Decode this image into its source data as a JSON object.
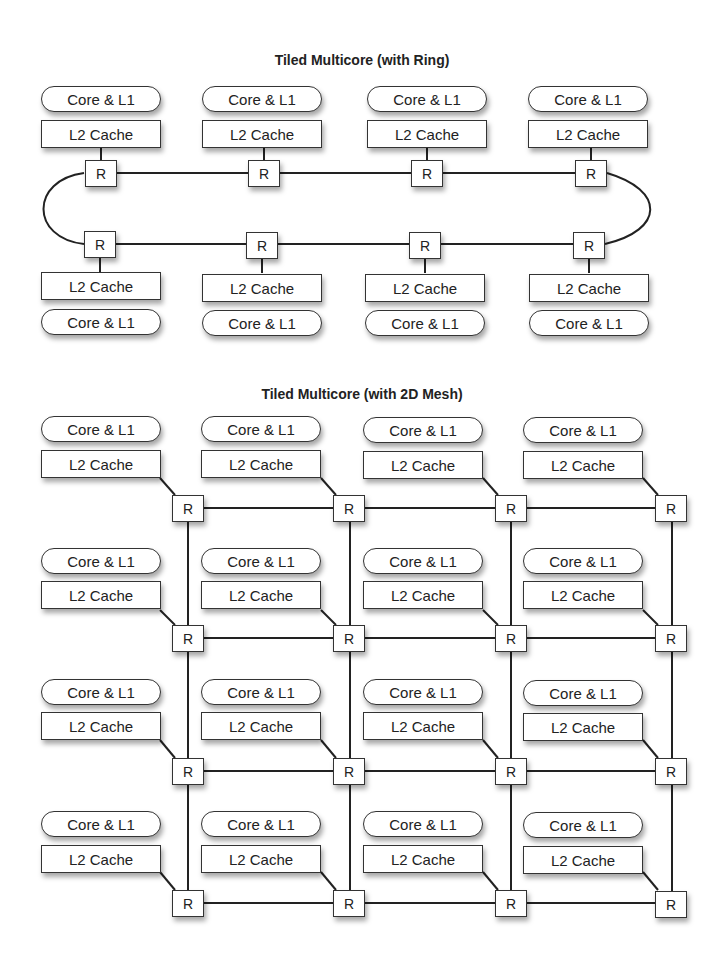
{
  "ring": {
    "title": "Tiled Multicore (with Ring)",
    "core_label": "Core & L1",
    "cache_label": "L2 Cache",
    "router_label": "R",
    "top_tiles": 4,
    "bottom_tiles": 4
  },
  "mesh": {
    "title": "Tiled Multicore (with 2D Mesh)",
    "core_label": "Core & L1",
    "cache_label": "L2 Cache",
    "router_label": "R",
    "rows": 4,
    "cols": 4
  }
}
